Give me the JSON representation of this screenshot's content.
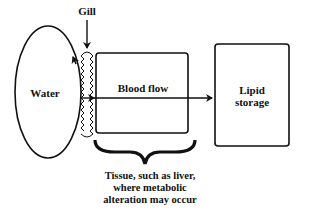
{
  "labels": {
    "gill": "Gill",
    "water": "Water",
    "blood_flow": "Blood flow",
    "lipid_storage_line1": "Lipid",
    "lipid_storage_line2": "storage",
    "tissue_line1": "Tissue, such as liver,",
    "tissue_line2": "where metabolic",
    "tissue_line3": "alteration may occur"
  }
}
